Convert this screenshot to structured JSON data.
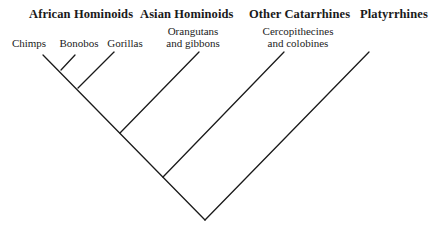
{
  "diagram": {
    "type": "cladogram",
    "groups": [
      {
        "label": "African Hominoids",
        "x": 29
      },
      {
        "label": "Asian Hominoids",
        "x": 140
      },
      {
        "label": "Other Catarrhines",
        "x": 249
      },
      {
        "label": "Platyrrhines",
        "x": 360
      }
    ],
    "leaves": [
      {
        "line1": "Chimps",
        "line2": "",
        "x": 5,
        "y": 37,
        "w": 48
      },
      {
        "line1": "Bonobos",
        "line2": "",
        "x": 57,
        "y": 37,
        "w": 44
      },
      {
        "line1": "Gorillas",
        "line2": "",
        "x": 103,
        "y": 37,
        "w": 44
      },
      {
        "line1": "Orangutans",
        "line2": "and gibbons",
        "x": 155,
        "y": 25,
        "w": 76
      },
      {
        "line1": "Cercopithecines",
        "line2": "and colobines",
        "x": 253,
        "y": 25,
        "w": 90
      }
    ],
    "branches": [
      {
        "from": "root",
        "x1": 205,
        "y1": 220,
        "x2": 43,
        "y2": 55
      },
      {
        "from": "root",
        "x1": 205,
        "y1": 220,
        "x2": 369,
        "y2": 52
      },
      {
        "from": "node-chimp-bonobo",
        "x1": 61,
        "y1": 70,
        "x2": 75,
        "y2": 55
      },
      {
        "from": "node-gorilla",
        "x1": 78,
        "y1": 88,
        "x2": 114,
        "y2": 52
      },
      {
        "from": "node-asian",
        "x1": 120,
        "y1": 133,
        "x2": 199,
        "y2": 52
      },
      {
        "from": "node-catarrhine",
        "x1": 163,
        "y1": 177,
        "x2": 284,
        "y2": 52
      }
    ]
  }
}
